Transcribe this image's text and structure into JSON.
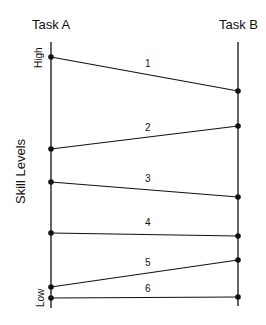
{
  "diagram": {
    "left_axis_title": "Task A",
    "right_axis_title": "Task B",
    "y_axis_title": "Skill Levels",
    "high_label": "High",
    "low_label": "Low",
    "axis_geometry": {
      "left_x": 51,
      "right_x": 238,
      "top_y": 42,
      "bottom_y": 308
    },
    "links": [
      {
        "label": "1",
        "a_y": 57,
        "b_y": 91,
        "label_x": 145,
        "label_y": 67
      },
      {
        "label": "2",
        "a_y": 149,
        "b_y": 126,
        "label_x": 145,
        "label_y": 131
      },
      {
        "label": "3",
        "a_y": 182,
        "b_y": 197,
        "label_x": 145,
        "label_y": 182
      },
      {
        "label": "4",
        "a_y": 233,
        "b_y": 236,
        "label_x": 145,
        "label_y": 226
      },
      {
        "label": "5",
        "a_y": 287,
        "b_y": 260,
        "label_x": 145,
        "label_y": 266
      },
      {
        "label": "6",
        "a_y": 298,
        "b_y": 297,
        "label_x": 145,
        "label_y": 292
      }
    ]
  }
}
